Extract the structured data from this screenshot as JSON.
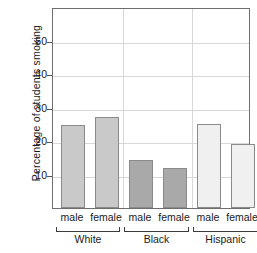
{
  "chart_data": {
    "type": "bar",
    "title": "",
    "xlabel": "",
    "ylabel": "Percentage of students smoking",
    "ylim": [
      0,
      60
    ],
    "yticks": [
      10,
      20,
      30,
      40,
      50
    ],
    "ytick_labels": [
      "10",
      "20",
      "30",
      "40",
      "50"
    ],
    "grid": true,
    "legend": "none",
    "groups": [
      {
        "name": "White",
        "color": "#c9c9c9",
        "bars": [
          {
            "label": "male",
            "value": 24.8
          },
          {
            "label": "female",
            "value": 27.2
          }
        ]
      },
      {
        "name": "Black",
        "color": "#a9a9a9",
        "bars": [
          {
            "label": "male",
            "value": 14.2
          },
          {
            "label": "female",
            "value": 12.0
          }
        ]
      },
      {
        "name": "Hispanic",
        "color": "#f0f0f0",
        "bars": [
          {
            "label": "male",
            "value": 25.0
          },
          {
            "label": "female",
            "value": 19.0
          }
        ]
      }
    ],
    "categories": [
      "male",
      "female",
      "male",
      "female",
      "male",
      "female"
    ],
    "series": [
      {
        "name": "Percentage of students smoking",
        "values": [
          24.8,
          27.2,
          14.2,
          12.0,
          25.0,
          19.0
        ]
      }
    ]
  },
  "colors": {
    "frame": "#6e6e6e",
    "grid": "#d8d8d8",
    "bar_edge": "#8a8a8a",
    "text": "#1a1a1a",
    "background": "#ffffff"
  }
}
